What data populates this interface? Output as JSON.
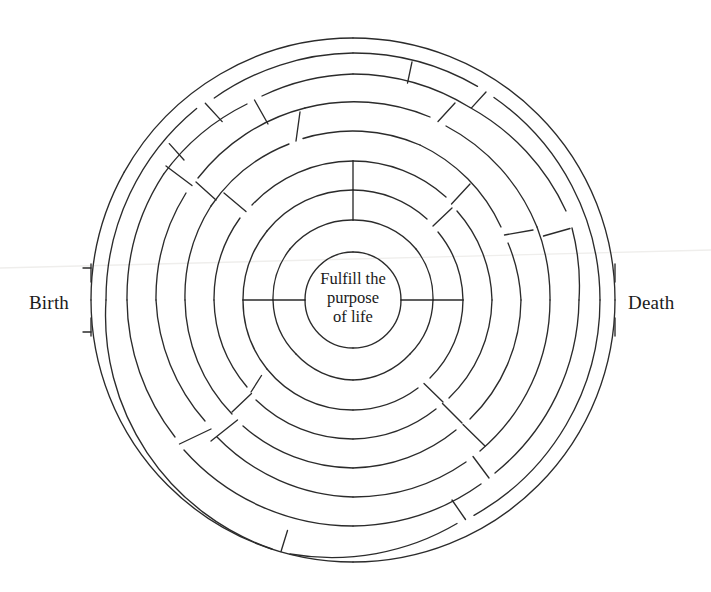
{
  "figure": {
    "type": "circular-maze-diagram",
    "title_text": null,
    "background_color": "#ffffff",
    "line_color": "#2b2b2b"
  },
  "labels": {
    "entrance": "Birth",
    "exit": "Death"
  },
  "center": {
    "line1": "Fulfill the",
    "line2": "purpose",
    "line3": "of life"
  },
  "geometry": {
    "center_x": 353,
    "center_y": 300,
    "ring_radii": [
      48,
      80,
      110,
      139,
      168,
      197,
      226,
      247,
      262
    ],
    "ring_count": 9,
    "entrance_angle_deg": 180,
    "exit_angle_deg": 0
  }
}
